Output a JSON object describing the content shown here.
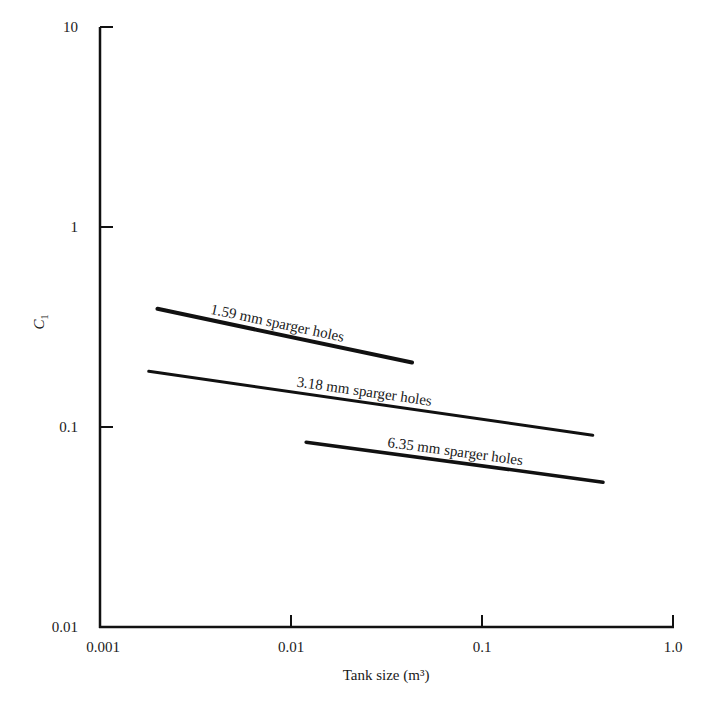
{
  "chart_data": {
    "type": "line",
    "title": "",
    "xlabel": "Tank size (m³)",
    "ylabel": "C",
    "ylabel_subscript": "1",
    "xscale": "log",
    "yscale": "log",
    "xlim": [
      0.001,
      1.0
    ],
    "ylim": [
      0.01,
      10
    ],
    "grid": false,
    "legend": "inline labels on lines",
    "x_ticks": [
      {
        "value": 0.001,
        "label": "0.001"
      },
      {
        "value": 0.01,
        "label": "0.01"
      },
      {
        "value": 0.1,
        "label": "0.1"
      },
      {
        "value": 1.0,
        "label": "1.0"
      }
    ],
    "y_ticks": [
      {
        "value": 0.01,
        "label": "0.01"
      },
      {
        "value": 0.1,
        "label": "0.1"
      },
      {
        "value": 1,
        "label": "1"
      },
      {
        "value": 10,
        "label": "10"
      }
    ],
    "series": [
      {
        "name": "1.59 mm sparger holes",
        "x": [
          0.002,
          0.043
        ],
        "y": [
          0.39,
          0.21
        ],
        "stroke_width": 4
      },
      {
        "name": "3.18 mm sparger holes",
        "x": [
          0.0018,
          0.38
        ],
        "y": [
          0.19,
          0.091
        ],
        "stroke_width": 3
      },
      {
        "name": "6.35 mm sparger holes",
        "x": [
          0.012,
          0.43
        ],
        "y": [
          0.084,
          0.053
        ],
        "stroke_width": 3.5
      }
    ],
    "line_color": "#111111"
  }
}
